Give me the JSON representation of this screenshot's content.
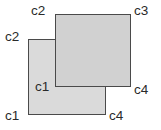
{
  "diagram": {
    "background_color": "#ffffff",
    "stroke_color": "#4a4a4a",
    "shapes": [
      {
        "id": "lower-rect",
        "name": "lower-left-rectangle",
        "fill_color": "#dadada",
        "x": 28,
        "y": 39,
        "width": 78,
        "height": 76,
        "z": 1
      },
      {
        "id": "upper-rect",
        "name": "upper-right-rectangle",
        "fill_color": "#d1d1d1",
        "x": 55,
        "y": 14,
        "width": 76,
        "height": 73,
        "z": 2
      }
    ],
    "labels": [
      {
        "id": "upper-tl",
        "text": "c2",
        "shape": "upper-rect",
        "corner": "top-left",
        "x": 31,
        "y": 4
      },
      {
        "id": "upper-tr",
        "text": "c3",
        "shape": "upper-rect",
        "corner": "top-right",
        "x": 134,
        "y": 4
      },
      {
        "id": "lower-tl",
        "text": "c2",
        "shape": "lower-rect",
        "corner": "top-left",
        "x": 5,
        "y": 30
      },
      {
        "id": "upper-bl",
        "text": "c1",
        "shape": "upper-rect",
        "corner": "bottom-left",
        "x": 35,
        "y": 80
      },
      {
        "id": "upper-br",
        "text": "c4",
        "shape": "upper-rect",
        "corner": "bottom-right",
        "x": 134,
        "y": 83
      },
      {
        "id": "lower-bl",
        "text": "c1",
        "shape": "lower-rect",
        "corner": "bottom-left",
        "x": 5,
        "y": 109
      },
      {
        "id": "lower-br",
        "text": "c4",
        "shape": "lower-rect",
        "corner": "bottom-right",
        "x": 109,
        "y": 109
      }
    ]
  }
}
